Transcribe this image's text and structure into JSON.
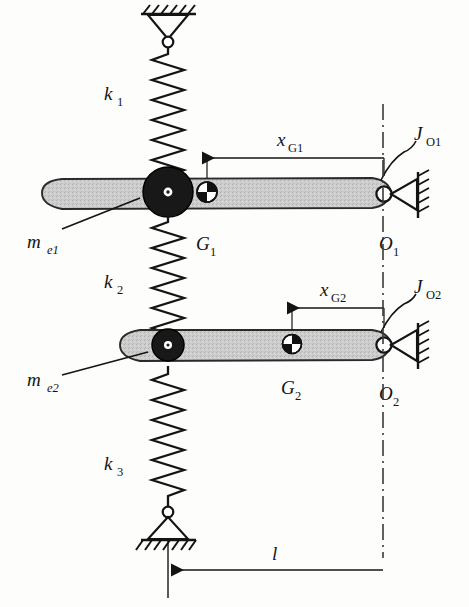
{
  "figure": {
    "background_color": "#fdfdfc",
    "ink_color": "#141414",
    "bar_fill_color": "#c9c9c9",
    "mass_color": "#1a1a1a"
  },
  "labels": {
    "k1": {
      "base": "k",
      "sub": "1"
    },
    "k2": {
      "base": "k",
      "sub": "2"
    },
    "k3": {
      "base": "k",
      "sub": "3"
    },
    "me1": {
      "base": "m",
      "sub": "e1"
    },
    "me2": {
      "base": "m",
      "sub": "e2"
    },
    "G1": {
      "base": "G",
      "sub": "1"
    },
    "G2": {
      "base": "G",
      "sub": "2"
    },
    "O1": {
      "base": "O",
      "sub": "1"
    },
    "O2": {
      "base": "O",
      "sub": "2"
    },
    "JO1": {
      "base": "J",
      "sub": "O1"
    },
    "JO2": {
      "base": "J",
      "sub": "O2"
    },
    "xG1": {
      "base": "x",
      "sub": "G1"
    },
    "xG2": {
      "base": "x",
      "sub": "G2"
    },
    "l": {
      "base": "l",
      "sub": ""
    }
  },
  "components": {
    "spring_top": {
      "name": "k1",
      "coils": 11,
      "from": "upper-ground-pin",
      "to": "bar1"
    },
    "spring_middle": {
      "name": "k2",
      "coils": 11,
      "from": "bar1",
      "to": "bar2"
    },
    "spring_bottom": {
      "name": "k3",
      "coils": 11,
      "from": "bar2",
      "to": "lower-ground-pin"
    },
    "bar1": {
      "pivot": "O1",
      "cg": "G1",
      "effective_mass": "me1",
      "inertia": "JO1",
      "cg_distance": "xG1"
    },
    "bar2": {
      "pivot": "O2",
      "cg": "G2",
      "effective_mass": "me2",
      "inertia": "JO2",
      "cg_distance": "xG2"
    },
    "dimension_l": {
      "name": "l",
      "from": "spring-axis",
      "to": "pivot-axis"
    }
  }
}
